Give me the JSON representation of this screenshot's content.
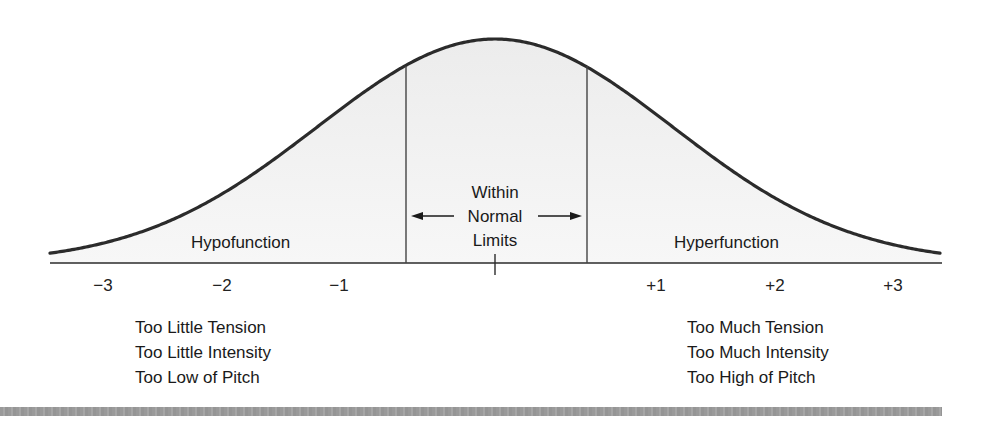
{
  "chart_data": {
    "type": "area",
    "title": "",
    "x_ticks": [
      "−3",
      "−2",
      "−1",
      "+1",
      "+2",
      "+3"
    ],
    "x_tick_values": [
      -3,
      -2,
      -1,
      1,
      2,
      3
    ],
    "center_tick": 0,
    "regions": [
      {
        "name": "Hypofunction",
        "range": [
          "-inf",
          -0.5
        ]
      },
      {
        "name": "Within Normal Limits",
        "range": [
          -0.5,
          0.5
        ]
      },
      {
        "name": "Hyperfunction",
        "range": [
          0.5,
          "inf"
        ]
      }
    ],
    "xlabel": "",
    "ylabel": "",
    "grid": false
  },
  "regions": {
    "hypo": "Hypofunction",
    "hyper": "Hyperfunction",
    "normal": [
      "Within",
      "Normal",
      "Limits"
    ]
  },
  "ticks": {
    "m3": "−3",
    "m2": "−2",
    "m1": "−1",
    "p1": "+1",
    "p2": "+2",
    "p3": "+3"
  },
  "hypo_list": [
    "Too Little Tension",
    "Too Little Intensity",
    "Too Low of Pitch"
  ],
  "hyper_list": [
    "Too Much Tension",
    "Too Much Intensity",
    "Too High of Pitch"
  ],
  "colors": {
    "curve": "#2b2b2b",
    "fill": "#f1f1f1",
    "band": "#9e9e9e"
  }
}
